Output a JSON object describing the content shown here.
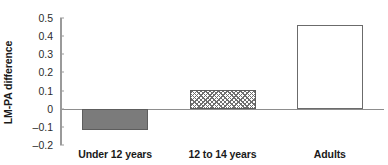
{
  "chart_data": {
    "type": "bar",
    "title": "",
    "xlabel": "",
    "ylabel": "LM-PA difference",
    "categories": [
      "Under 12 years",
      "12 to 14 years",
      "Adults"
    ],
    "values": [
      -0.115,
      0.105,
      0.46
    ],
    "series": [
      {
        "name": "LM-PA difference",
        "values": [
          -0.115,
          0.105,
          0.46
        ]
      }
    ],
    "bar_styles": [
      "solid-gray",
      "diagonal-hatch",
      "open-white"
    ],
    "ylim": [
      -0.2,
      0.5
    ],
    "ytick_values": [
      0.5,
      0.4,
      0.3,
      0.2,
      0.1,
      0,
      -0.1,
      -0.2
    ],
    "ytick_labels": [
      "0.5",
      "0.4",
      "0.3",
      "0.2",
      "0.1",
      "0",
      "–0.1",
      "–0.2"
    ],
    "grid": false,
    "legend": "none",
    "zero_line": true,
    "colors": {
      "bar_fill_gray": "#7b7b7b",
      "bar_outline": "#6b6b6b",
      "hatch_stroke": "#6f6f6f",
      "axis": "#9a9a9a",
      "zero_line": "#8d8d8d",
      "text": "#1a1a1a"
    }
  }
}
